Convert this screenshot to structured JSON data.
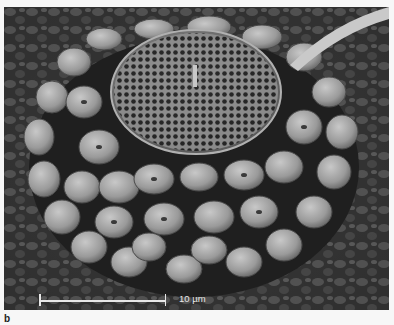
{
  "figure": {
    "panel_label": "b",
    "scale_bar": {
      "label": "10 µm"
    },
    "colors": {
      "background": "#2a2a2a",
      "plate_light": "#b8b8b8",
      "plate_mid": "#8c8c8c",
      "frame": "#f7f7f7"
    }
  }
}
